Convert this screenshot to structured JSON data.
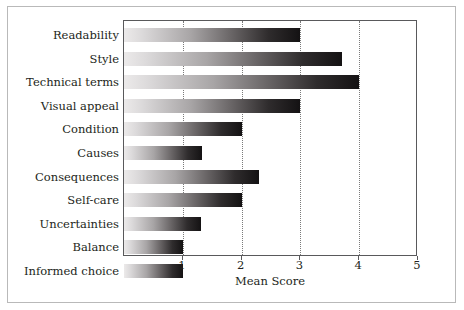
{
  "chart_data": {
    "type": "bar",
    "orientation": "horizontal",
    "title": "",
    "xlabel": "Mean Score",
    "ylabel": "",
    "xlim": [
      0,
      5
    ],
    "xticks": [
      "1",
      "2",
      "3",
      "4",
      "5"
    ],
    "xtick_values": [
      1,
      2,
      3,
      4,
      5
    ],
    "grid": "vertical dotted gridlines at each integer tick",
    "legend": "none",
    "categories": [
      "Readability",
      "Style",
      "Technical terms",
      "Visual appeal",
      "Condition",
      "Causes",
      "Consequences",
      "Self-care",
      "Uncertainties",
      "Balance",
      "Informed choice"
    ],
    "values": [
      3.0,
      3.7,
      4.0,
      3.0,
      2.0,
      1.33,
      2.3,
      2.0,
      1.31,
      1.0,
      1.0
    ],
    "bar_style": {
      "gradient_from": "#eceaea",
      "gradient_to": "#141213",
      "direction": "left-to-right"
    },
    "colors": {
      "axis": "#59595b",
      "gridline": "#7a7a7a",
      "text": "#231f20",
      "frame": "#b9b9b9",
      "background": "#ffffff"
    }
  }
}
